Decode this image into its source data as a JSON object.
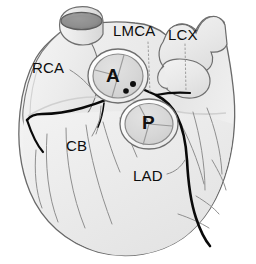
{
  "figure": {
    "width": 256,
    "height": 264,
    "background_color": "#ffffff"
  },
  "labels": [
    {
      "id": "rca",
      "text": "RCA",
      "meaning": "right coronary artery"
    },
    {
      "id": "lmca",
      "text": "LMCA",
      "meaning": "left main coronary artery"
    },
    {
      "id": "lcx",
      "text": "LCX",
      "meaning": "left circumflex artery"
    },
    {
      "id": "cb",
      "text": "CB",
      "meaning": "conus branch"
    },
    {
      "id": "lad",
      "text": "LAD",
      "meaning": "left anterior descending artery"
    }
  ],
  "valves": [
    {
      "id": "aortic",
      "letter": "A",
      "meaning": "aortic valve",
      "cusps": 3,
      "ostia_count": 2
    },
    {
      "id": "pulmonary",
      "letter": "P",
      "meaning": "pulmonary valve",
      "cusps": 3,
      "ostia_count": 0
    }
  ],
  "colors": {
    "myocardium_fill": "#ececec",
    "myocardium_light": "#f4f4f4",
    "valve_fill": "#d8d8d8",
    "valve_ring": "#fbfbfb",
    "outline": "#5a5a5a",
    "artery_dark": "#0a0a0a",
    "vessel_lumen": "#8e8e8e",
    "label_text": "#0d0d0d",
    "leader_line": "#8a8a8a"
  }
}
